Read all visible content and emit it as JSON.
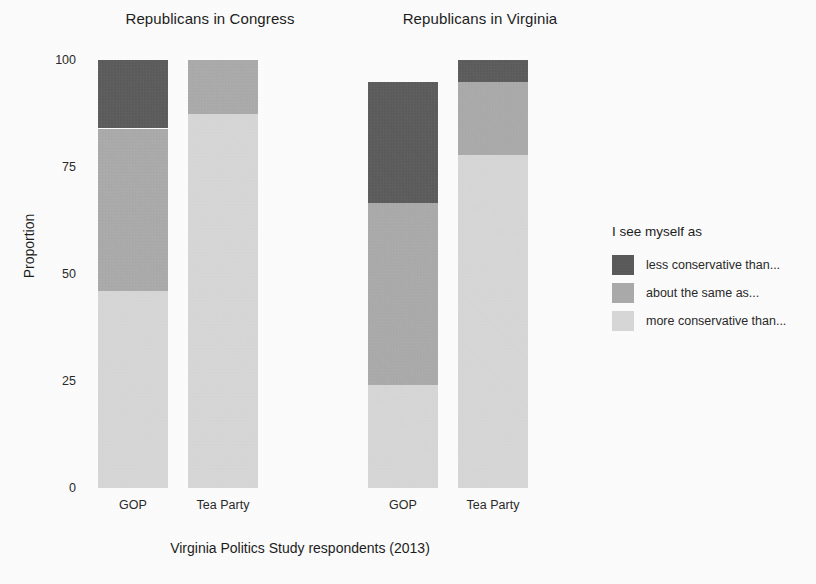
{
  "chart_data": {
    "type": "bar",
    "subtype": "stacked-bar-proportion",
    "title": "",
    "xlabel": "Virginia Politics Study respondents (2013)",
    "ylabel": "Proportion",
    "ylim": [
      0,
      100
    ],
    "yticks": [
      0,
      25,
      50,
      75,
      100
    ],
    "ytick_labels": [
      "0",
      "25",
      "50",
      "75",
      "100"
    ],
    "grid": false,
    "legend_position": "right",
    "legend_title": "I see myself as",
    "categories": [
      "GOP",
      "Tea Party"
    ],
    "panels": [
      {
        "title": "Republicans in Congress",
        "bars": [
          {
            "category": "GOP",
            "total": 100,
            "segments": [
              {
                "name": "less conservative than...",
                "value": 16.0,
                "from": 84.0,
                "to": 100.0
              },
              {
                "name": "about the same as...",
                "value": 38.0,
                "from": 46.0,
                "to": 84.0
              },
              {
                "name": "more conservative than...",
                "value": 46.0,
                "from": 0.0,
                "to": 46.0
              }
            ]
          },
          {
            "category": "Tea Party",
            "total": 100,
            "segments": [
              {
                "name": "less conservative than...",
                "value": 0.0,
                "from": 100.0,
                "to": 100.0
              },
              {
                "name": "about the same as...",
                "value": 12.5,
                "from": 87.5,
                "to": 100.0
              },
              {
                "name": "more conservative than...",
                "value": 87.5,
                "from": 0.0,
                "to": 87.5
              }
            ]
          }
        ]
      },
      {
        "title": "Republicans in Virginia",
        "bars": [
          {
            "category": "GOP",
            "total": 94.8,
            "segments": [
              {
                "name": "less conservative than...",
                "value": 28.3,
                "from": 66.5,
                "to": 94.8
              },
              {
                "name": "about the same as...",
                "value": 42.5,
                "from": 24.0,
                "to": 66.5
              },
              {
                "name": "more conservative than...",
                "value": 24.0,
                "from": 0.0,
                "to": 24.0
              }
            ]
          },
          {
            "category": "Tea Party",
            "total": 100,
            "segments": [
              {
                "name": "less conservative than...",
                "value": 5.2,
                "from": 94.8,
                "to": 100.0
              },
              {
                "name": "about the same as...",
                "value": 17.0,
                "from": 77.8,
                "to": 94.8
              },
              {
                "name": "more conservative than...",
                "value": 77.8,
                "from": 0.0,
                "to": 77.8
              }
            ]
          }
        ]
      }
    ],
    "series": [
      {
        "name": "less conservative than...",
        "color": "#4d4d4d"
      },
      {
        "name": "about the same as...",
        "color": "#a8a8a8"
      },
      {
        "name": "more conservative than...",
        "color": "#dcdcdc"
      }
    ]
  },
  "panel_titles": {
    "congress": "Republicans in Congress",
    "virginia": "Republicans in Virginia"
  },
  "axes": {
    "y_title": "Proportion",
    "x_title": "Virginia Politics Study respondents (2013)",
    "y_ticks": [
      "100",
      "75",
      "50",
      "25",
      "0"
    ],
    "x_ticks": [
      "GOP",
      "Tea Party"
    ]
  },
  "legend": {
    "title": "I see myself as",
    "entries": [
      {
        "label": "less conservative than...",
        "color": "#4d4d4d"
      },
      {
        "label": "about the same as...",
        "color": "#a8a8a8"
      },
      {
        "label": "more conservative than...",
        "color": "#dcdcdc"
      }
    ]
  },
  "colors": {
    "dark": "#4d4d4d",
    "medium": "#a8a8a8",
    "light": "#dcdcdc",
    "background": "#fefefe",
    "text": "#1d1d1d"
  }
}
